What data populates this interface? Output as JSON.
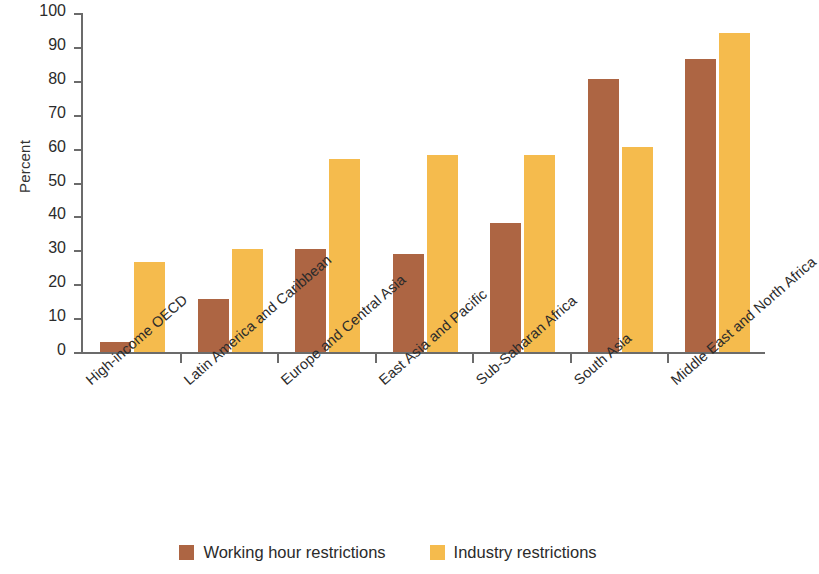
{
  "chart_data": {
    "type": "bar",
    "title": "",
    "xlabel": "",
    "ylabel": "Percent",
    "ylim": [
      0,
      100
    ],
    "yticks": [
      0,
      10,
      20,
      30,
      40,
      50,
      60,
      70,
      80,
      90,
      100
    ],
    "grid": false,
    "legend_position": "bottom",
    "categories": [
      "High-income OECD",
      "Latin America and Caribbean",
      "Europe and Central Asia",
      "East Asia and Pacific",
      "Sub-Saharan Africa",
      "South Asia",
      "Middle East and North Africa"
    ],
    "series": [
      {
        "name": "Working hour restrictions",
        "color": "#ad6543",
        "values": [
          3,
          15.5,
          30.5,
          29,
          38,
          80.5,
          86.5
        ]
      },
      {
        "name": "Industry restrictions",
        "color": "#f5bb4d",
        "values": [
          26.5,
          30.5,
          57,
          58,
          58,
          60.5,
          94
        ]
      }
    ]
  },
  "axis": {
    "y_title": "Percent"
  },
  "legend": {
    "items": [
      {
        "label": "Working hour restrictions",
        "color": "#ad6543"
      },
      {
        "label": "Industry restrictions",
        "color": "#f5bb4d"
      }
    ]
  }
}
